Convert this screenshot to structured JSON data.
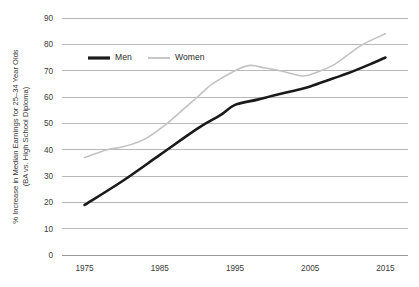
{
  "chart_data": {
    "type": "line",
    "title": "",
    "xlabel": "",
    "ylabel": "% Increase in Median Earnings for 25–34 Year Olds",
    "ylabel_line2": "(BA vs. High School Diploma)",
    "xlim": [
      1972,
      2018
    ],
    "ylim": [
      0,
      90
    ],
    "x_ticks": [
      1975,
      1985,
      1995,
      2005,
      2015
    ],
    "y_ticks": [
      0,
      10,
      20,
      30,
      40,
      50,
      60,
      70,
      80,
      90
    ],
    "grid": "horizontal",
    "legend_position": "top-left-inside",
    "series": [
      {
        "name": "Men",
        "color": "#1a1a1a",
        "width": 2.6,
        "x": [
          1975,
          1980,
          1985,
          1990,
          1993,
          1995,
          1998,
          2000,
          2003,
          2005,
          2008,
          2010,
          2013,
          2015
        ],
        "values": [
          19,
          28,
          38,
          48,
          53,
          57,
          59,
          60.5,
          62.5,
          64,
          67,
          69,
          72.5,
          75
        ]
      },
      {
        "name": "Women",
        "color": "#c2c2c2",
        "width": 1.6,
        "x": [
          1975,
          1978,
          1980,
          1983,
          1986,
          1988,
          1990,
          1992,
          1995,
          1997,
          1999,
          2001,
          2004,
          2006,
          2008,
          2010,
          2012,
          2015
        ],
        "values": [
          37,
          40,
          41,
          44,
          50,
          55,
          60,
          65,
          70,
          72,
          71,
          70,
          68,
          69.5,
          72,
          76,
          80,
          84
        ]
      }
    ]
  },
  "legend": {
    "items": [
      {
        "label": "Men",
        "color": "#1a1a1a",
        "width": 3.2
      },
      {
        "label": "Women",
        "color": "#c2c2c2",
        "width": 1.8
      }
    ]
  },
  "axis": {
    "y_tick_labels": [
      "90",
      "80",
      "70",
      "60",
      "50",
      "40",
      "30",
      "20",
      "10",
      "0"
    ],
    "x_tick_labels": [
      "1975",
      "1985",
      "1995",
      "2005",
      "2015"
    ]
  }
}
